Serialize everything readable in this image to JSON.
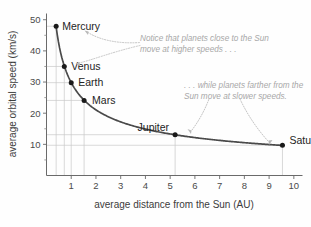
{
  "chart_data": {
    "type": "scatter",
    "title": "",
    "xlabel": "average distance from the Sun (AU)",
    "ylabel": "average orbital speed (km/s)",
    "xlim": [
      0,
      10.35
    ],
    "ylim": [
      0,
      52
    ],
    "grid": "drop-lines from each point to both axes",
    "legend": "none",
    "x_ticks": [
      "1",
      "2",
      "3",
      "4",
      "5",
      "6",
      "7",
      "8",
      "9",
      "10"
    ],
    "x_tick_values": [
      1,
      2,
      3,
      4,
      5,
      6,
      7,
      8,
      9,
      10
    ],
    "y_ticks": [
      "10",
      "20",
      "30",
      "40",
      "50"
    ],
    "y_tick_values": [
      10,
      20,
      30,
      40,
      50
    ],
    "y_minor_tick_values": [
      5,
      15,
      25,
      35,
      45
    ],
    "series": [
      {
        "name": "planets",
        "points": [
          {
            "label": "Mercury",
            "x": 0.39,
            "y": 47.9
          },
          {
            "label": "Venus",
            "x": 0.72,
            "y": 35.0
          },
          {
            "label": "Earth",
            "x": 1.0,
            "y": 29.8
          },
          {
            "label": "Mars",
            "x": 1.52,
            "y": 24.1
          },
          {
            "label": "Jupiter",
            "x": 5.2,
            "y": 13.1
          },
          {
            "label": "Saturn",
            "x": 9.54,
            "y": 9.7
          }
        ]
      }
    ],
    "curve_description": "smooth decreasing inverse-square-root curve v ~ 29.8 / sqrt(d)",
    "annotations": [
      {
        "id": "annotation-high-speed",
        "line1": "Notice that planets close to the Sun",
        "line2": "move at higher speeds . . ."
      },
      {
        "id": "annotation-slow-speed",
        "line1": ". . . while planets farther from the",
        "line2": "Sun move at slower speeds."
      }
    ],
    "colors": {
      "curve": "#4a4a4a",
      "point": "#1a1a1a",
      "gridline": "#c9c9c9",
      "axis": "#6a6a6a",
      "annotation_text": "#a8a8a8",
      "label_text": "#242424",
      "background": "#fefefe"
    }
  }
}
